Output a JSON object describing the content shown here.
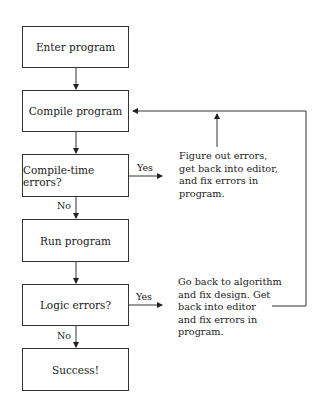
{
  "flowchart": {
    "steps": [
      {
        "id": "enter",
        "label": "Enter program"
      },
      {
        "id": "compile",
        "label": "Compile program"
      },
      {
        "id": "compile_errors",
        "label": "Compile-time errors?"
      },
      {
        "id": "run",
        "label": "Run program"
      },
      {
        "id": "logic_errors",
        "label": "Logic errors?"
      },
      {
        "id": "success",
        "label": "Success!"
      }
    ],
    "branches": {
      "compile_yes": "Yes",
      "compile_no": "No",
      "logic_yes": "Yes",
      "logic_no": "No"
    },
    "notes": {
      "compile_fix": [
        "Figure out errors,",
        "get back into editor,",
        "and fix errors in",
        "program."
      ],
      "logic_fix": [
        "Go back to algorithm",
        "and fix design. Get",
        "back into editor",
        "and fix errors in",
        "program."
      ]
    }
  }
}
